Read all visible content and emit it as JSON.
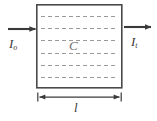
{
  "figure": {
    "canvas": {
      "width": 157,
      "height": 121,
      "background": "#ffffff"
    },
    "colors": {
      "stroke": "#3a3a3a",
      "box_border": "#4a4a4a",
      "dashed_line": "#9a9a9a",
      "label": "#3a3a3a",
      "concentration_label": "#6d6d6d",
      "background": "#ffffff"
    },
    "cell": {
      "name": "sample-cell",
      "x": 36,
      "y": 4,
      "width": 86,
      "height": 84,
      "border_width": 1.6,
      "dashed_line_count": 6,
      "dash_pattern": "4 3"
    },
    "labels": {
      "incident_symbol": "I",
      "incident_subscript": "o",
      "transmitted_symbol": "I",
      "transmitted_subscript": "t",
      "concentration": "C",
      "path_length": "l"
    },
    "arrows": {
      "incident": {
        "x1": 8,
        "x2": 36,
        "y": 29,
        "direction": "right"
      },
      "transmitted": {
        "x1": 124,
        "x2": 152,
        "y": 27,
        "direction": "right"
      }
    },
    "dimension": {
      "name": "path-length-dimension",
      "x1": 38,
      "x2": 121,
      "y": 97,
      "arrowheads": "both",
      "label": "l"
    }
  }
}
